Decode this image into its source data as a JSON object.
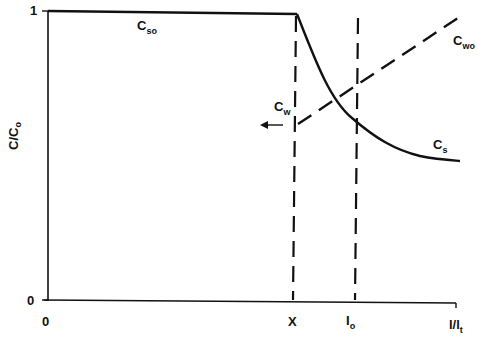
{
  "diagram": {
    "y_axis": {
      "label_main": "C/C",
      "label_sub": "o",
      "ticks": [
        "1",
        "0"
      ]
    },
    "x_axis": {
      "origin": "0",
      "marker_x": "X",
      "marker_io_main": "I",
      "marker_io_sub": "o",
      "end_main": "l/l",
      "end_sub": "t"
    },
    "curves": [
      {
        "main": "C",
        "sub": "so",
        "style": "solid"
      },
      {
        "main": "C",
        "sub": "s",
        "style": "solid"
      },
      {
        "main": "C",
        "sub": "wo",
        "style": "dashed"
      },
      {
        "main": "C",
        "sub": "w",
        "style": "dashed"
      }
    ],
    "arrow": {
      "direction": "left"
    },
    "colors": {
      "line": "#111111",
      "background": "#ffffff"
    }
  }
}
